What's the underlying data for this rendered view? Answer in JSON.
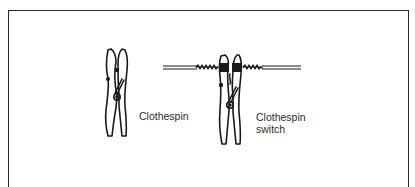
{
  "figure": {
    "labels": {
      "clothespin": "Clothespin",
      "switch_line1": "Clothespin",
      "switch_line2": "switch"
    },
    "colors": {
      "ink": "#1a1a1a",
      "background": "#ffffff"
    },
    "items": [
      {
        "name": "clothespin",
        "label": "Clothespin"
      },
      {
        "name": "clothespin-switch",
        "label": "Clothespin switch"
      }
    ]
  }
}
